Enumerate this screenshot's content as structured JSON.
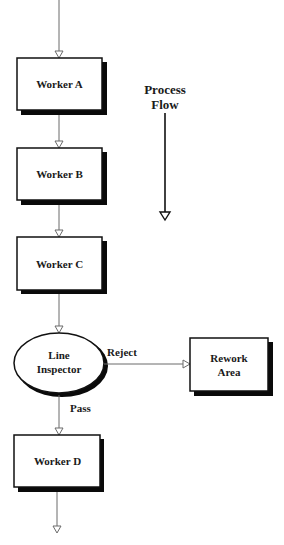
{
  "diagram": {
    "title_label": {
      "line1": "Process",
      "line2": "Flow"
    },
    "nodes": [
      {
        "id": "worker-a",
        "label": "Worker A",
        "shape": "rectangle"
      },
      {
        "id": "worker-b",
        "label": "Worker B",
        "shape": "rectangle"
      },
      {
        "id": "worker-c",
        "label": "Worker C",
        "shape": "rectangle"
      },
      {
        "id": "line-inspector",
        "label_line1": "Line",
        "label_line2": "Inspector",
        "shape": "ellipse"
      },
      {
        "id": "rework-area",
        "label_line1": "Rework",
        "label_line2": "Area",
        "shape": "rectangle"
      },
      {
        "id": "worker-d",
        "label": "Worker D",
        "shape": "rectangle"
      }
    ],
    "edges": [
      {
        "from": "start",
        "to": "worker-a",
        "label": ""
      },
      {
        "from": "worker-a",
        "to": "worker-b",
        "label": ""
      },
      {
        "from": "worker-b",
        "to": "worker-c",
        "label": ""
      },
      {
        "from": "worker-c",
        "to": "line-inspector",
        "label": ""
      },
      {
        "from": "line-inspector",
        "to": "rework-area",
        "label": "Reject"
      },
      {
        "from": "line-inspector",
        "to": "worker-d",
        "label": "Pass"
      },
      {
        "from": "worker-d",
        "to": "end",
        "label": ""
      }
    ],
    "colors": {
      "stroke": "#111111",
      "connector": "#6a6a6a",
      "shadow": "#0a0a0a",
      "background": "#ffffff"
    }
  }
}
